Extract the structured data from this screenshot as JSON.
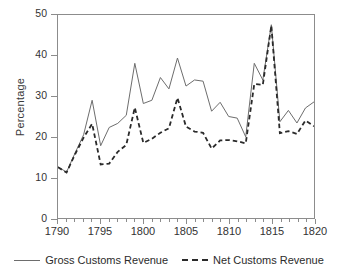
{
  "chart_data": {
    "type": "line",
    "title": "",
    "xlabel": "",
    "ylabel": "Percentage",
    "xlim": [
      1790,
      1820
    ],
    "ylim": [
      0,
      50
    ],
    "xticks": [
      1790,
      1795,
      1800,
      1805,
      1810,
      1815,
      1820
    ],
    "xtick_labels": [
      "1790",
      "1795",
      "1800",
      "1805",
      "1810",
      "1815",
      "1820"
    ],
    "yticks": [
      0,
      10,
      20,
      30,
      40,
      50
    ],
    "ytick_labels": [
      "0",
      "10",
      "20",
      "30",
      "40",
      "50"
    ],
    "grid": false,
    "legend_position": "bottom",
    "x": [
      1790,
      1791,
      1792,
      1793,
      1794,
      1795,
      1796,
      1797,
      1798,
      1799,
      1800,
      1801,
      1802,
      1803,
      1804,
      1805,
      1806,
      1807,
      1808,
      1809,
      1810,
      1811,
      1812,
      1813,
      1814,
      1815,
      1816,
      1817,
      1818,
      1819,
      1820
    ],
    "series": [
      {
        "name": "Gross Customs Revenue",
        "style": "solid",
        "color": "#6d6d6d",
        "values": [
          12.6,
          11.3,
          16.0,
          20.5,
          29.0,
          17.8,
          22.3,
          23.3,
          25.3,
          38.1,
          28.2,
          29.0,
          34.6,
          31.8,
          39.4,
          32.5,
          34.0,
          33.7,
          26.3,
          28.5,
          25.0,
          24.6,
          20.0,
          38.1,
          34.0,
          47.6,
          23.7,
          26.5,
          23.4,
          27.1,
          28.6
        ]
      },
      {
        "name": "Net Customs Revenue",
        "style": "dashed",
        "color": "#2a2a2a",
        "values": [
          12.5,
          11.2,
          15.7,
          19.8,
          23.2,
          13.2,
          13.4,
          16.3,
          18.0,
          27.2,
          18.5,
          19.5,
          21.0,
          22.1,
          29.6,
          22.5,
          21.3,
          21.0,
          17.1,
          19.1,
          19.2,
          18.9,
          18.4,
          33.0,
          32.8,
          47.4,
          20.9,
          21.4,
          20.7,
          24.0,
          22.6
        ]
      }
    ]
  },
  "legend": {
    "items": [
      {
        "label": "Gross Customs Revenue",
        "style": "solid"
      },
      {
        "label": "Net Customs Revenue",
        "style": "dashed"
      }
    ]
  }
}
